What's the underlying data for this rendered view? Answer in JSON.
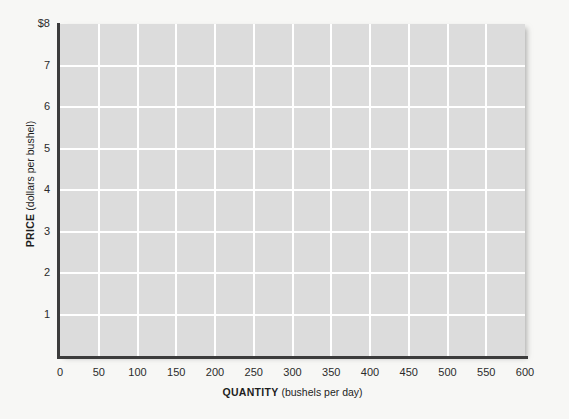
{
  "chart_data": {
    "type": "line",
    "title": "",
    "subtitle": "",
    "xlabel_bold": "QUANTITY",
    "xlabel_unit": "(bushels per day)",
    "ylabel_bold": "PRICE",
    "ylabel_unit": "(dollars per bushel)",
    "xlim": [
      0,
      600
    ],
    "ylim": [
      0,
      8
    ],
    "x_ticks": [
      0,
      50,
      100,
      150,
      200,
      250,
      300,
      350,
      400,
      450,
      500,
      550,
      600
    ],
    "x_tick_labels": [
      "0",
      "50",
      "100",
      "150",
      "200",
      "250",
      "300",
      "350",
      "400",
      "450",
      "500",
      "550",
      "600"
    ],
    "y_ticks": [
      1,
      2,
      3,
      4,
      5,
      6,
      7,
      8
    ],
    "y_tick_labels": [
      "1",
      "2",
      "3",
      "4",
      "5",
      "6",
      "7",
      "$8"
    ],
    "grid": true,
    "grid_color": "#ffffff",
    "grid_x_interval": 50,
    "grid_y_interval": 1,
    "plot_background": "#dcdcdc",
    "figure_background": "#f7f7f5",
    "axis_color": "#3c3c3c",
    "legend": null,
    "legend_position": "none",
    "series": [],
    "annotations": [],
    "note": "Empty grid: no data series plotted"
  },
  "figure": {
    "x_axis_label_bold": "QUANTITY",
    "x_axis_label_unit": "(bushels per day)",
    "y_axis_label_bold": "PRICE",
    "y_axis_label_unit": "(dollars per bushel)"
  }
}
